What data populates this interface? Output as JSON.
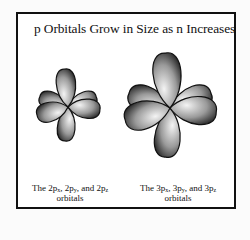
{
  "title": "p Orbitals Grow in Size as n Increases",
  "diagrams": [
    {
      "name": "2p orbitals",
      "caption_prefix": "The ",
      "parts": [
        {
          "n": "2p",
          "sub": "x",
          "sep": ", "
        },
        {
          "n": "2p",
          "sub": "y",
          "sep": ", and "
        },
        {
          "n": "2p",
          "sub": "z",
          "sep": ""
        }
      ],
      "caption_line2": "orbitals"
    },
    {
      "name": "3p orbitals",
      "caption_prefix": "The ",
      "parts": [
        {
          "n": "3p",
          "sub": "x",
          "sep": ", "
        },
        {
          "n": "3p",
          "sub": "y",
          "sep": ", and "
        },
        {
          "n": "3p",
          "sub": "z",
          "sep": ""
        }
      ],
      "caption_line2": "orbitals"
    }
  ],
  "colors": {
    "lobe_light": "#f4f4f4",
    "lobe_dark": "#1a1a1a",
    "outline": "#111111"
  }
}
